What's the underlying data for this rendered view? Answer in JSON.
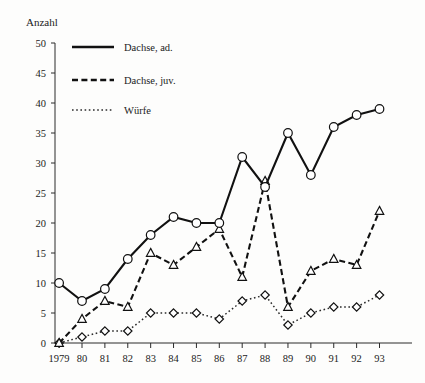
{
  "chart_data": {
    "type": "line",
    "title": "",
    "ylabel": "Anzahl",
    "xlabel": "",
    "grid": false,
    "legend_position": "top-left-inside",
    "ylim": [
      0,
      50
    ],
    "ytick_step": 5,
    "yticks": [
      "0",
      "5",
      "10",
      "15",
      "20",
      "25",
      "30",
      "35",
      "40",
      "45",
      "50"
    ],
    "categories": [
      "1979",
      "80",
      "81",
      "82",
      "83",
      "84",
      "85",
      "86",
      "87",
      "88",
      "89",
      "90",
      "91",
      "92",
      "93"
    ],
    "series": [
      {
        "name": "Dachse, ad.",
        "marker": "circle",
        "linestyle": "solid",
        "values": [
          10,
          7,
          9,
          14,
          18,
          21,
          20,
          20,
          31,
          26,
          35,
          28,
          36,
          38,
          39
        ]
      },
      {
        "name": "Dachse, juv.",
        "marker": "triangle",
        "linestyle": "dashed",
        "values": [
          0,
          4,
          7,
          6,
          15,
          13,
          16,
          19,
          11,
          27,
          6,
          12,
          14,
          13,
          22
        ]
      },
      {
        "name": "Würfe",
        "marker": "diamond",
        "linestyle": "dotted",
        "values": [
          0,
          1,
          2,
          2,
          5,
          5,
          5,
          4,
          7,
          8,
          3,
          5,
          6,
          6,
          8
        ]
      }
    ]
  },
  "axis": {
    "y_title": "Anzahl"
  },
  "legend": {
    "items": [
      {
        "label": "Dachse, ad."
      },
      {
        "label": "Dachse, juv."
      },
      {
        "label": "Würfe"
      }
    ]
  }
}
